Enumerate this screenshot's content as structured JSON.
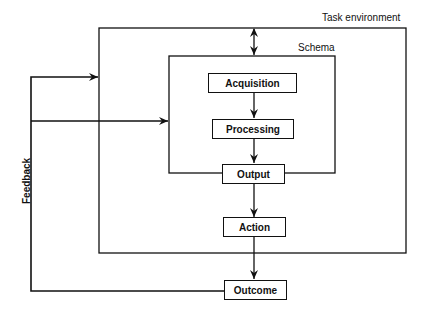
{
  "diagram": {
    "containers": {
      "task_environment": {
        "label": "Task environment"
      },
      "schema": {
        "label": "Schema"
      }
    },
    "nodes": [
      {
        "id": "acquisition",
        "label": "Acquisition"
      },
      {
        "id": "processing",
        "label": "Processing"
      },
      {
        "id": "output",
        "label": "Output"
      },
      {
        "id": "action",
        "label": "Action"
      },
      {
        "id": "outcome",
        "label": "Outcome"
      }
    ],
    "feedback_label": "Feedback",
    "edges": [
      {
        "from": "task_environment",
        "to": "schema",
        "type": "bidirectional"
      },
      {
        "from": "acquisition",
        "to": "processing"
      },
      {
        "from": "processing",
        "to": "output"
      },
      {
        "from": "output",
        "to": "action"
      },
      {
        "from": "action",
        "to": "outcome"
      },
      {
        "from": "outcome",
        "to": "task_environment",
        "label": "Feedback"
      },
      {
        "from": "outcome",
        "to": "schema",
        "label": "Feedback"
      }
    ]
  }
}
